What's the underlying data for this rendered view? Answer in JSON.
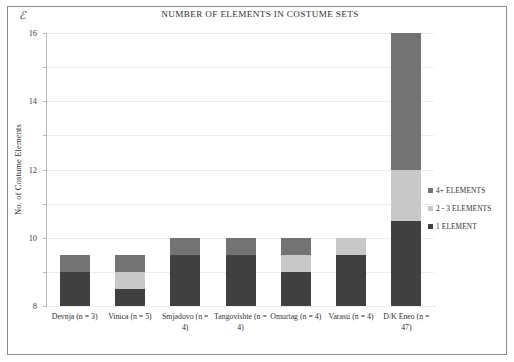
{
  "figure": {
    "corner_mark": "ℰ",
    "title": "NUMBER OF ELEMENTS IN COSTUME SETS"
  },
  "legend": {
    "position": "right",
    "items": [
      {
        "label": "4+ ELEMENTS",
        "color": "#737373"
      },
      {
        "label": "2 - 3 ELEMENTS",
        "color": "#c8c8c8"
      },
      {
        "label": "1 ELEMENT",
        "color": "#404040"
      }
    ]
  },
  "chart_data": {
    "type": "bar",
    "subtype": "stacked-vertical",
    "title": "NUMBER OF ELEMENTS IN COSTUME SETS",
    "xlabel": "",
    "ylabel": "No. of Costume Elements",
    "ylim": [
      0,
      16
    ],
    "ytick_labels": [
      "0",
      "2",
      "4",
      "6",
      "8",
      "10",
      "12",
      "14",
      "16"
    ],
    "yticks": [
      0,
      2,
      4,
      6,
      8,
      10,
      12,
      14,
      16
    ],
    "grid": true,
    "categories": [
      "Devnja (n = 3)",
      "Vinica (n = 5)",
      "Smjadovo (n = 4)",
      "Tangovishte (n = 4)",
      "Omurtag (n = 4)",
      "Varasti (n = 4)",
      "D/K Eneo (n = 47)"
    ],
    "series": [
      {
        "name": "1 ELEMENT",
        "color": "#404040",
        "values": [
          2,
          1,
          3,
          3,
          2,
          3,
          5
        ]
      },
      {
        "name": "2 - 3 ELEMENTS",
        "color": "#c8c8c8",
        "values": [
          0,
          1,
          0,
          0,
          1,
          1,
          3
        ]
      },
      {
        "name": "4+ ELEMENTS",
        "color": "#737373",
        "values": [
          1,
          1,
          1,
          1,
          1,
          0,
          8
        ]
      }
    ],
    "totals": [
      3,
      3,
      4,
      4,
      4,
      4,
      16
    ]
  }
}
